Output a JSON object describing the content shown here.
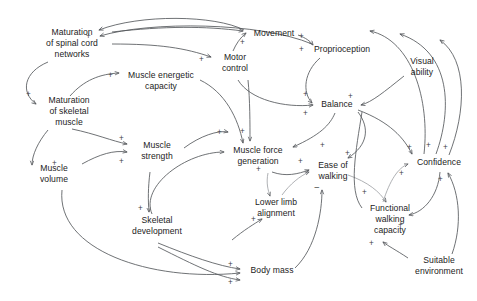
{
  "diagram": {
    "type": "causal-loop-diagram",
    "background_color": "#ffffff",
    "link_color": "#55585c",
    "text_color": "#232323",
    "nodes": [
      {
        "id": "maturation_spinal",
        "label": "Maturation\nof spinal cord\nnetworks",
        "x": 30,
        "y": 27,
        "w": 84
      },
      {
        "id": "maturation_skeletal",
        "label": "Maturation\nof skeletal\nmuscle",
        "x": 38,
        "y": 95,
        "w": 62
      },
      {
        "id": "muscle_energetic",
        "label": "Muscle energetic\ncapacity",
        "x": 122,
        "y": 70,
        "w": 78
      },
      {
        "id": "motor_control",
        "label": "Motor\ncontrol",
        "x": 211,
        "y": 52,
        "w": 48
      },
      {
        "id": "movement",
        "label": "Movement",
        "x": 248,
        "y": 28,
        "w": 52
      },
      {
        "id": "proprioception",
        "label": "Proprioception",
        "x": 306,
        "y": 44,
        "w": 72
      },
      {
        "id": "visual_ability",
        "label": "Visual\nability",
        "x": 400,
        "y": 56,
        "w": 44
      },
      {
        "id": "balance",
        "label": "Balance",
        "x": 315,
        "y": 99,
        "w": 44
      },
      {
        "id": "muscle_strength",
        "label": "Muscle\nstrength",
        "x": 130,
        "y": 140,
        "w": 54
      },
      {
        "id": "muscle_volume",
        "label": "Muscle\nvolume",
        "x": 28,
        "y": 163,
        "w": 52
      },
      {
        "id": "muscle_force",
        "label": "Muscle force\ngeneration",
        "x": 222,
        "y": 145,
        "w": 72
      },
      {
        "id": "ease_walking",
        "label": "Ease of\nwalking",
        "x": 311,
        "y": 160,
        "w": 44
      },
      {
        "id": "confidence",
        "label": "Confidence",
        "x": 410,
        "y": 157,
        "w": 58
      },
      {
        "id": "lower_limb",
        "label": "Lower limb\nalignment",
        "x": 246,
        "y": 197,
        "w": 60
      },
      {
        "id": "skeletal_dev",
        "label": "Skeletal\ndevelopment",
        "x": 118,
        "y": 215,
        "w": 78
      },
      {
        "id": "functional_walking",
        "label": "Functional\nwalking\ncapacity",
        "x": 357,
        "y": 203,
        "w": 66
      },
      {
        "id": "suitable_env",
        "label": "Suitable\nenvironment",
        "x": 404,
        "y": 255,
        "w": 70
      },
      {
        "id": "body_mass",
        "label": "Body mass",
        "x": 245,
        "y": 265,
        "w": 54
      }
    ],
    "signs": [
      {
        "id": "s1",
        "text": "+",
        "x": 86,
        "y": 33
      },
      {
        "id": "s2",
        "text": "+",
        "x": 26,
        "y": 91
      },
      {
        "id": "s3",
        "text": "+",
        "x": 108,
        "y": 72
      },
      {
        "id": "s4",
        "text": "+",
        "x": 199,
        "y": 56
      },
      {
        "id": "s5",
        "text": "+",
        "x": 240,
        "y": 39
      },
      {
        "id": "s6",
        "text": "+",
        "x": 299,
        "y": 33
      },
      {
        "id": "s7",
        "text": "+",
        "x": 299,
        "y": 46
      },
      {
        "id": "s8",
        "text": "+",
        "x": 303,
        "y": 91
      },
      {
        "id": "s9",
        "text": "+",
        "x": 303,
        "y": 110
      },
      {
        "id": "s10",
        "text": "+",
        "x": 348,
        "y": 93
      },
      {
        "id": "s11",
        "text": "+",
        "x": 119,
        "y": 135
      },
      {
        "id": "s12",
        "text": "+",
        "x": 119,
        "y": 158
      },
      {
        "id": "s13",
        "text": "+",
        "x": 52,
        "y": 160
      },
      {
        "id": "s14",
        "text": "+",
        "x": 217,
        "y": 129
      },
      {
        "id": "s15",
        "text": "+",
        "x": 240,
        "y": 128
      },
      {
        "id": "s16",
        "text": "+",
        "x": 256,
        "y": 166
      },
      {
        "id": "s17",
        "text": "+",
        "x": 298,
        "y": 158
      },
      {
        "id": "s18",
        "text": "+",
        "x": 320,
        "y": 142
      },
      {
        "id": "s19",
        "text": "+",
        "x": 345,
        "y": 150
      },
      {
        "id": "s20",
        "text": "+",
        "x": 251,
        "y": 216
      },
      {
        "id": "s21",
        "text": "−",
        "x": 314,
        "y": 184,
        "minus": true
      },
      {
        "id": "s22",
        "text": "+",
        "x": 138,
        "y": 205
      },
      {
        "id": "s23",
        "text": "+",
        "x": 362,
        "y": 189
      },
      {
        "id": "s24",
        "text": "+",
        "x": 398,
        "y": 222
      },
      {
        "id": "s25",
        "text": "+",
        "x": 369,
        "y": 240
      },
      {
        "id": "s26",
        "text": "+",
        "x": 407,
        "y": 144
      },
      {
        "id": "s27",
        "text": "+",
        "x": 426,
        "y": 142
      },
      {
        "id": "s28",
        "text": "+",
        "x": 443,
        "y": 144
      },
      {
        "id": "s29",
        "text": "+",
        "x": 399,
        "y": 170
      },
      {
        "id": "s30",
        "text": "+",
        "x": 438,
        "y": 176
      },
      {
        "id": "s31",
        "text": "+",
        "x": 228,
        "y": 261
      },
      {
        "id": "s32",
        "text": "+",
        "x": 228,
        "y": 279
      }
    ]
  }
}
